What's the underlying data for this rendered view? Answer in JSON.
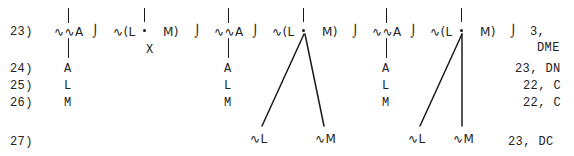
{
  "document": {
    "kind": "typewritten-derivation-with-trees",
    "background_color": "#ffffff",
    "ink_color": "#1b1b1b"
  },
  "line_numbers": [
    {
      "label": "23)"
    },
    {
      "label": "24)"
    },
    {
      "label": "25)"
    },
    {
      "label": "26)"
    },
    {
      "label": "27)"
    }
  ],
  "row23": {
    "tokens": [
      {
        "text": "∿∿A"
      },
      {
        "text": "⌡"
      },
      {
        "text": "∿(L"
      },
      {
        "text": "M)"
      },
      {
        "text": "⌡"
      },
      {
        "text": "∿∿A"
      },
      {
        "text": "⌡"
      },
      {
        "text": "∿(L"
      },
      {
        "text": "M)"
      },
      {
        "text": "⌡"
      },
      {
        "text": "∿∿A"
      },
      {
        "text": "⌡"
      },
      {
        "text": "∿(L"
      },
      {
        "text": "M)"
      },
      {
        "text": "⌡"
      },
      {
        "text": "3,"
      }
    ],
    "x_mark": "X"
  },
  "columns": {
    "col1": [
      "A",
      "L",
      "M"
    ],
    "col2": [
      "A",
      "L",
      "M"
    ],
    "col3": [
      "A",
      "L",
      "M"
    ]
  },
  "row27": {
    "left_tree_leaves": [
      "∿L",
      "∿M"
    ],
    "right_tree_leaves": [
      "∿L",
      "∿M"
    ]
  },
  "right_column": [
    {
      "text": "DME"
    },
    {
      "text": "23, DN"
    },
    {
      "text": "22, C"
    },
    {
      "text": "22, C"
    },
    {
      "text": "23, DC"
    }
  ]
}
